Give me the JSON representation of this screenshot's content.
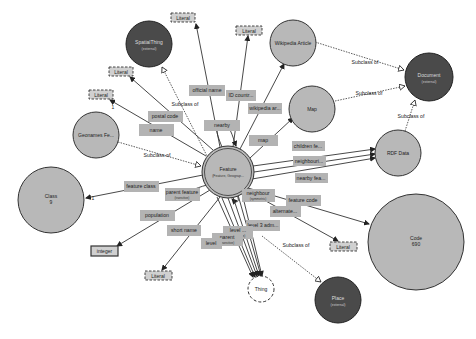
{
  "diagram": {
    "type": "ontology-graph",
    "center_node": {
      "label": "Feature",
      "sublabel": "(Feature, Geograp...",
      "x": 228,
      "y": 172,
      "r": 26
    },
    "class_nodes": [
      {
        "id": "spatial",
        "label": "SpatialThing",
        "sublabel": "(external)",
        "x": 149,
        "y": 44,
        "r": 23,
        "external": true
      },
      {
        "id": "wikipedia",
        "label": "Wikipedia Article",
        "x": 293,
        "y": 43,
        "r": 23,
        "external": false
      },
      {
        "id": "document",
        "label": "Document",
        "sublabel": "(external)",
        "x": 429,
        "y": 77,
        "r": 24,
        "external": true
      },
      {
        "id": "map",
        "label": "Map",
        "x": 312,
        "y": 109,
        "r": 23,
        "external": false
      },
      {
        "id": "geonames",
        "label": "Geonames Fe...",
        "x": 96,
        "y": 135,
        "r": 23,
        "external": false
      },
      {
        "id": "rdfdata",
        "label": "RDF Data",
        "x": 398,
        "y": 153,
        "r": 23,
        "external": false
      },
      {
        "id": "class",
        "label": "Class",
        "sublabel": "9",
        "x": 51,
        "y": 200,
        "r": 33,
        "external": false
      },
      {
        "id": "code",
        "label": "Code",
        "sublabel": "690",
        "x": 416,
        "y": 242,
        "r": 48,
        "external": false
      },
      {
        "id": "place",
        "label": "Place",
        "sublabel": "(external)",
        "x": 338,
        "y": 300,
        "r": 23,
        "external": true
      }
    ],
    "thing_node": {
      "label": "Thing",
      "x": 261,
      "y": 289,
      "r": 13
    },
    "literals": [
      {
        "id": "lit1",
        "label": "Literal",
        "x": 183,
        "y": 18
      },
      {
        "id": "lit2",
        "label": "Literal",
        "x": 121,
        "y": 72
      },
      {
        "id": "lit3",
        "label": "Literal",
        "x": 101,
        "y": 95
      },
      {
        "id": "lit4",
        "label": "Literal",
        "x": 244,
        "y": 31
      },
      {
        "id": "lit5",
        "label": "Literal",
        "x": 158,
        "y": 276
      },
      {
        "id": "lit6",
        "label": "Literal",
        "x": 340,
        "y": 246
      }
    ],
    "datatypes": [
      {
        "id": "integer",
        "label": "integer",
        "x": 104,
        "y": 251
      }
    ],
    "properties": [
      {
        "label": "official name",
        "x": 207,
        "y": 91,
        "w": 35
      },
      {
        "label": "ID countr...",
        "x": 241,
        "y": 96,
        "w": 30
      },
      {
        "label": "wikipedia ar...",
        "x": 265,
        "y": 109,
        "w": 33
      },
      {
        "label": "postal code",
        "x": 162,
        "y": 117,
        "w": 34
      },
      {
        "label": "name",
        "x": 156,
        "y": 131,
        "w": 33
      },
      {
        "label": "nearby",
        "x": 222,
        "y": 126,
        "w": 32
      },
      {
        "label": "map",
        "x": 263,
        "y": 141,
        "w": 28
      },
      {
        "label": "children fe...",
        "x": 308,
        "y": 147,
        "w": 32
      },
      {
        "label": "neighbouri...",
        "x": 309,
        "y": 162,
        "w": 32
      },
      {
        "label": "nearby fea...",
        "x": 312,
        "y": 179,
        "w": 32
      },
      {
        "label": "feature class",
        "x": 141,
        "y": 187,
        "w": 34
      },
      {
        "label": "parent feature",
        "sublabel": "(transitive)",
        "x": 176,
        "y": 193,
        "w": 34
      },
      {
        "label": "neighbour",
        "sublabel": "(symmetric)",
        "x": 241,
        "y": 195,
        "w": 32
      },
      {
        "label": "feature code",
        "x": 296,
        "y": 201,
        "w": 34
      },
      {
        "label": "alternate...",
        "x": 277,
        "y": 212,
        "w": 30
      },
      {
        "label": "population",
        "x": 153,
        "y": 216,
        "w": 34
      },
      {
        "label": "level 3 adm...",
        "x": 250,
        "y": 226,
        "w": 33
      },
      {
        "label": "short name",
        "x": 180,
        "y": 231,
        "w": 33
      },
      {
        "label": "level ...",
        "sublabel": "(transitive)",
        "x": 238,
        "y": 233,
        "w": 30
      },
      {
        "label": "parent",
        "sublabel": "(transitive)",
        "x": 227,
        "y": 240,
        "w": 30
      },
      {
        "label": "level",
        "x": 211,
        "y": 243,
        "w": 20
      }
    ],
    "subclass_labels": [
      {
        "label": "Subclass of",
        "x": 185,
        "y": 104
      },
      {
        "label": "Subclass of",
        "x": 157,
        "y": 155
      },
      {
        "label": "Subclass of",
        "x": 365,
        "y": 62
      },
      {
        "label": "Subclass of",
        "x": 369,
        "y": 93
      },
      {
        "label": "Subclass of",
        "x": 411,
        "y": 116
      },
      {
        "label": "Subclass of",
        "x": 296,
        "y": 245
      }
    ],
    "cardinality_labels": [
      {
        "label": "1",
        "x": 93,
        "y": 199
      },
      {
        "label": "1",
        "x": 113,
        "y": 108
      }
    ],
    "colors": {
      "class_fill": "#b8b8b8",
      "external_fill": "#4a4a4a",
      "property_fill": "#b3b3b3",
      "literal_fill": "#d0d0d0",
      "edge": "#333333",
      "background": "#ffffff"
    }
  }
}
